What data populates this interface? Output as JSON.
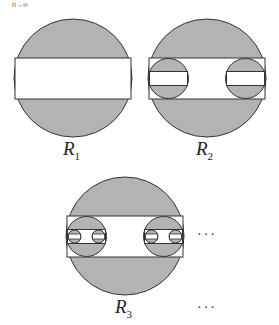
{
  "caption": "n→∞",
  "figures": [
    {
      "label": "R",
      "sub": "1"
    },
    {
      "label": "R",
      "sub": "2"
    },
    {
      "label": "R",
      "sub": "3"
    }
  ],
  "ellipsis": [
    "···",
    "···"
  ],
  "colors": {
    "shade": "#b3b3b3",
    "stroke": "#333333",
    "fill": "#ffffff"
  }
}
